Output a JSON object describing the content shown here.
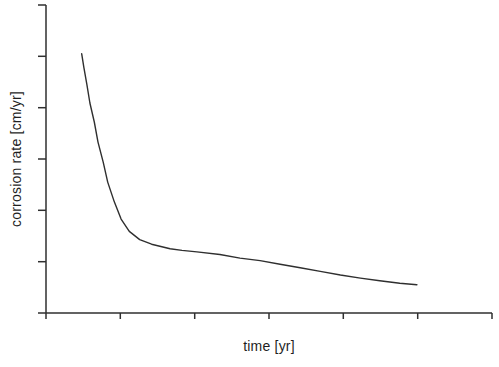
{
  "figure": {
    "background": "#ffffff",
    "line_color": "#2f2f2f",
    "text_color": "#1f1f1f"
  },
  "chart_data": {
    "type": "line",
    "title": "",
    "xlabel": "time [yr]",
    "ylabel": "corrosion rate [cm/yr]",
    "grid": false,
    "legend": false,
    "note": "Schematic plot: axis ticks carry no numeric labels; coordinates are in tick units (1 unit = 1 tick interval).",
    "x_axis": {
      "range": [
        0,
        6
      ],
      "tick_positions": [
        0,
        1,
        2,
        3,
        4,
        5,
        6
      ],
      "tick_labels": [],
      "labels_shown": false
    },
    "y_axis": {
      "range": [
        0,
        6
      ],
      "tick_positions": [
        0,
        1,
        2,
        3,
        4,
        5,
        6
      ],
      "tick_labels": [],
      "labels_shown": false
    },
    "series": [
      {
        "name": "corrosion-rate-curve",
        "points": [
          [
            0.48,
            5.05
          ],
          [
            0.51,
            4.78
          ],
          [
            0.55,
            4.45
          ],
          [
            0.59,
            4.09
          ],
          [
            0.65,
            3.72
          ],
          [
            0.7,
            3.33
          ],
          [
            0.77,
            2.94
          ],
          [
            0.83,
            2.55
          ],
          [
            0.92,
            2.16
          ],
          [
            1.01,
            1.83
          ],
          [
            1.12,
            1.59
          ],
          [
            1.26,
            1.43
          ],
          [
            1.42,
            1.34
          ],
          [
            1.67,
            1.25
          ],
          [
            1.83,
            1.22
          ],
          [
            2.03,
            1.19
          ],
          [
            2.34,
            1.14
          ],
          [
            2.61,
            1.07
          ],
          [
            2.88,
            1.02
          ],
          [
            3.15,
            0.95
          ],
          [
            3.42,
            0.88
          ],
          [
            3.69,
            0.81
          ],
          [
            3.96,
            0.74
          ],
          [
            4.23,
            0.68
          ],
          [
            4.49,
            0.63
          ],
          [
            4.76,
            0.58
          ],
          [
            4.99,
            0.55
          ]
        ]
      }
    ]
  }
}
